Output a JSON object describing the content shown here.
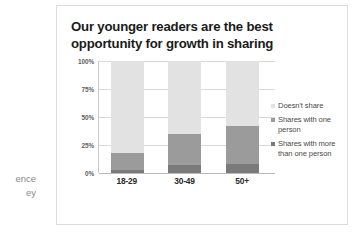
{
  "side_text": {
    "line1": "ence",
    "line2": "ey"
  },
  "slide": {
    "title": "Our younger readers are the best opportunity for growth in sharing"
  },
  "colors": {
    "doesnt_share": "#e2e2e2",
    "shares_one": "#9b9b9b",
    "shares_more": "#7a7a7a",
    "gridline": "#d8d8d8",
    "axis": "#b9b9b9",
    "title": "#1b1b1b",
    "card_border": "#dcdcdc"
  },
  "chart_data": {
    "type": "bar",
    "title": "Our younger readers are the best opportunity for growth in sharing",
    "xlabel": "",
    "ylabel": "",
    "stacked": true,
    "stack_mode": "percent",
    "grid": true,
    "legend_position": "right",
    "ylim": [
      0,
      100
    ],
    "yticks": [
      0,
      25,
      50,
      75,
      100
    ],
    "ytick_labels": [
      "0%",
      "25%",
      "50%",
      "75%",
      "100%"
    ],
    "categories": [
      "18-29",
      "30-49",
      "50+"
    ],
    "series": [
      {
        "name": "Shares with more than one person",
        "color": "#7a7a7a",
        "values": [
          3,
          7,
          8
        ]
      },
      {
        "name": "Shares with one person",
        "color": "#9b9b9b",
        "values": [
          15,
          28,
          34
        ]
      },
      {
        "name": "Doesn't share",
        "color": "#e2e2e2",
        "values": [
          82,
          65,
          58
        ]
      }
    ],
    "legend": [
      {
        "label": "Doesn't share",
        "color": "#e2e2e2"
      },
      {
        "label": "Shares with one person",
        "color": "#9b9b9b"
      },
      {
        "label": "Shares with more than one person",
        "color": "#7a7a7a"
      }
    ]
  }
}
